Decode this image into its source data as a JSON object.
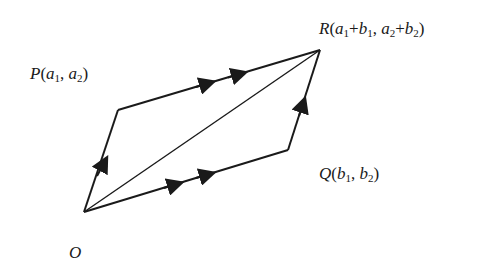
{
  "diagram": {
    "points": {
      "O": {
        "name": "O",
        "x": 84,
        "y": 212
      },
      "P": {
        "name": "P",
        "x": 118,
        "y": 110
      },
      "R": {
        "name": "R",
        "x": 320,
        "y": 50
      },
      "Q": {
        "name": "Q",
        "x": 288,
        "y": 150
      }
    },
    "labels": {
      "P": {
        "letter": "P",
        "open": "(",
        "a": "a",
        "sub1": "1",
        "sep": ", ",
        "a2": "a",
        "sub2": "2",
        "close": ")"
      },
      "Q": {
        "letter": "Q",
        "open": "(",
        "b": "b",
        "sub1": "1",
        "sep": ", ",
        "b2": "b",
        "sub2": "2",
        "close": ")"
      },
      "R": {
        "letter": "R",
        "open": "(",
        "a1": "a",
        "s1": "1",
        "plus1": "+",
        "b1": "b",
        "s2": "1",
        "sep": ", ",
        "a2": "a",
        "s3": "2",
        "plus2": "+",
        "b2": "b",
        "s4": "2",
        "close": ")"
      },
      "O": {
        "letter": "O"
      }
    },
    "edges": [
      {
        "from": "O",
        "to": "P",
        "arrows": 1
      },
      {
        "from": "P",
        "to": "R",
        "arrows": 2
      },
      {
        "from": "O",
        "to": "Q",
        "arrows": 2
      },
      {
        "from": "Q",
        "to": "R",
        "arrows": 1
      },
      {
        "from": "O",
        "to": "R",
        "arrows": 0
      }
    ],
    "colors": {
      "stroke": "#1a1a1a",
      "background": "#ffffff"
    }
  }
}
